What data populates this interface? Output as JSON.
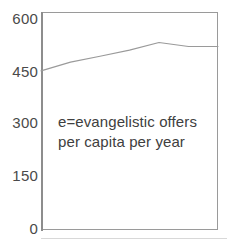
{
  "chart_data": {
    "type": "line",
    "title": "",
    "subtitle": "",
    "xlabel": "",
    "ylabel": "",
    "ylim": [
      0,
      600
    ],
    "yticks": [
      0,
      150,
      300,
      450,
      600
    ],
    "ytick_labels": [
      "0",
      "150",
      "300",
      "450",
      "600"
    ],
    "grid": false,
    "legend": "none",
    "x": [
      0,
      1,
      2,
      3,
      4,
      5,
      6
    ],
    "series": [
      {
        "name": "e",
        "values": [
          438,
          462,
          478,
          495,
          516,
          505,
          505
        ],
        "color": "#9a9a9a"
      }
    ],
    "annotations": [
      {
        "name": "series-definition",
        "lines": [
          "e=evangelistic offers",
          "per capita per year"
        ]
      }
    ],
    "colors": {
      "axis": "#9a9a9a",
      "spine": "#8d8d8d",
      "tick_text": "#4a4a4a",
      "annotation_text": "#404040",
      "series_line": "#9a9a9a",
      "background": "#ffffff"
    }
  }
}
